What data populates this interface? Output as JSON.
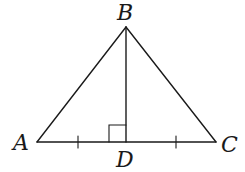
{
  "diagram": {
    "type": "geometry",
    "points": {
      "A": {
        "label": "A",
        "x": 37,
        "y": 142
      },
      "B": {
        "label": "B",
        "x": 126,
        "y": 27
      },
      "C": {
        "label": "C",
        "x": 216,
        "y": 142
      },
      "D": {
        "label": "D",
        "x": 126,
        "y": 142
      }
    },
    "segments": [
      "AB",
      "BC",
      "AC",
      "BD"
    ],
    "right_angle_at": "D",
    "equal_tick_segments": [
      "AD",
      "DC"
    ],
    "stroke_color": "#1a1a1a",
    "background_color": "#ffffff"
  }
}
